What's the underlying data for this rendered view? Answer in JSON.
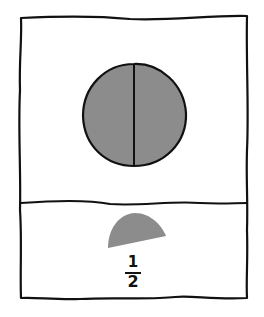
{
  "diagram": {
    "type": "fraction-illustration",
    "top_panel": {
      "shape": "circle",
      "parts": 2,
      "divider": "vertical",
      "fill_color": "#8c8c8c",
      "stroke_color": "#111111"
    },
    "bottom_panel": {
      "shape": "half-circle",
      "fill_color": "#8c8c8c",
      "fraction": {
        "numerator": "1",
        "denominator": "2"
      }
    }
  }
}
